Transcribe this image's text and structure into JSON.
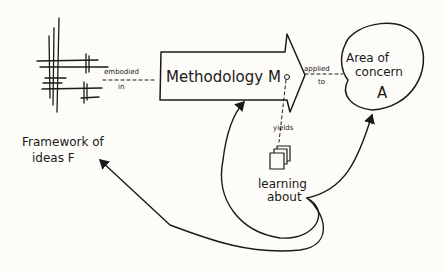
{
  "diagram": {
    "framework": {
      "label_line1": "Framework of",
      "label_line2": "ideas F"
    },
    "methodology": {
      "label": "Methodology M"
    },
    "area": {
      "label_line1": "Area of",
      "label_line2": "concern",
      "label_line3": "A"
    },
    "learning": {
      "label_line1": "learning",
      "label_line2": "about"
    },
    "edges": {
      "embodied": {
        "line1": "embodied",
        "line2": "in"
      },
      "applied": {
        "line1": "applied",
        "line2": "to"
      },
      "yields": {
        "label": "yields"
      }
    }
  }
}
